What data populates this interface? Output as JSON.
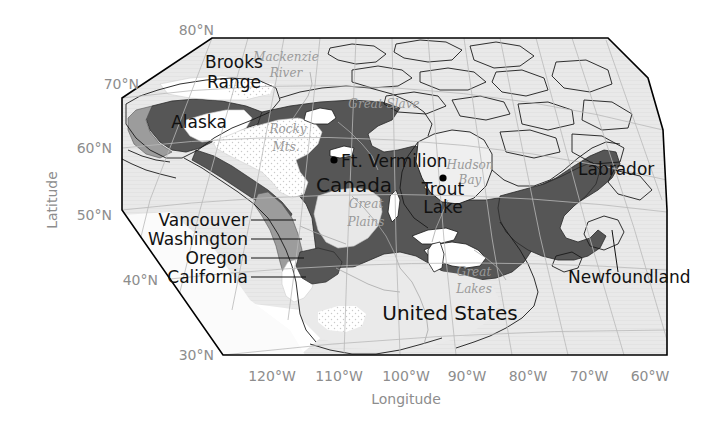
{
  "figure": {
    "type": "map",
    "projection_note": "North America, conic-style graticule",
    "background_color": "#ffffff",
    "frame_color": "#000000"
  },
  "axes": {
    "y_axis": {
      "title": "Latitude",
      "ticks": [
        "80°N",
        "70°N",
        "60°N",
        "50°N",
        "40°N",
        "30°N"
      ],
      "tick_color": "#8d8d8d"
    },
    "x_axis": {
      "title": "Longitude",
      "ticks": [
        "120°W",
        "110°W",
        "100°W",
        "90°W",
        "80°W",
        "70°W",
        "60°W"
      ],
      "tick_color": "#8d8d8d"
    }
  },
  "legend_colors": {
    "dark_shaded_region": "#565656",
    "medium_shaded_region": "#9c9c9c",
    "land_background": "#e6e6e6",
    "white_region": "#ffffff",
    "stippled_region": "#f4f4f4",
    "ocean": "#ffffff"
  },
  "labels": {
    "countries": [
      {
        "name": "Alaska",
        "text": "Alaska",
        "x": 168,
        "y": 122
      },
      {
        "name": "Canada",
        "text": "Canada",
        "x": 322,
        "y": 184
      },
      {
        "name": "United States",
        "text": "United States",
        "x": 450,
        "y": 313
      }
    ],
    "regions": [
      {
        "name": "Brooks Range line 1",
        "text": "Brooks",
        "x": 196,
        "y": 62
      },
      {
        "name": "Brooks Range line 2",
        "text": "Range",
        "x": 197,
        "y": 81
      },
      {
        "name": "Labrador",
        "text": "Labrador",
        "x": 578,
        "y": 170
      },
      {
        "name": "Newfoundland",
        "text": "Newfoundland",
        "x": 572,
        "y": 278
      }
    ],
    "coastal_states": [
      {
        "name": "Vancouver",
        "text": "Vancouver",
        "x": 168,
        "y": 224
      },
      {
        "name": "Washington",
        "text": "Washington",
        "x": 160,
        "y": 243
      },
      {
        "name": "Oregon",
        "text": "Oregon",
        "x": 186,
        "y": 262
      },
      {
        "name": "California",
        "text": "California",
        "x": 168,
        "y": 281
      }
    ],
    "cities": [
      {
        "name": "Ft. Vermilion",
        "text": "Ft. Vermilion",
        "x": 342,
        "y": 167,
        "dot_x": 334,
        "dot_y": 160
      },
      {
        "name": "Trout Lake line 1",
        "text": "Trout",
        "x": 437,
        "y": 188,
        "dot_x": 443,
        "dot_y": 178
      },
      {
        "name": "Trout Lake line 2",
        "text": "Lake",
        "x": 440,
        "y": 206
      }
    ],
    "physiographic": [
      {
        "name": "Mackenzie River line 1",
        "text": "Mackenzie",
        "x": 256,
        "y": 57
      },
      {
        "name": "Mackenzie River line 2",
        "text": "River",
        "x": 270,
        "y": 73
      },
      {
        "name": "Great Slave",
        "text": "Great Slave",
        "x": 352,
        "y": 104
      },
      {
        "name": "Hudson Bay line 1",
        "text": "Hudson",
        "x": 444,
        "y": 165
      },
      {
        "name": "Hudson Bay line 2",
        "text": "Bay",
        "x": 455,
        "y": 180
      },
      {
        "name": "Rocky Mts line 1",
        "text": "Rocky",
        "x": 272,
        "y": 128
      },
      {
        "name": "Rocky Mts line 2",
        "text": "Mts.",
        "x": 276,
        "y": 146
      },
      {
        "name": "Great Plains line 1",
        "text": "Great",
        "x": 356,
        "y": 203
      },
      {
        "name": "Great Plains line 2",
        "text": "Plains",
        "x": 353,
        "y": 221
      },
      {
        "name": "Great Lakes line 1",
        "text": "Great",
        "x": 465,
        "y": 271
      },
      {
        "name": "Great Lakes line 2",
        "text": "Lakes",
        "x": 462,
        "y": 288
      }
    ]
  },
  "tick_positions": {
    "latitude": [
      {
        "label": "80°N",
        "x": 188,
        "y": 30
      },
      {
        "label": "70°N",
        "x": 113,
        "y": 84
      },
      {
        "label": "60°N",
        "x": 86,
        "y": 148
      },
      {
        "label": "50°N",
        "x": 86,
        "y": 215
      },
      {
        "label": "40°N",
        "x": 132,
        "y": 280
      },
      {
        "label": "30°N",
        "x": 188,
        "y": 357
      }
    ],
    "longitude": [
      {
        "label": "120°W",
        "x": 272,
        "y": 376
      },
      {
        "label": "110°W",
        "x": 339,
        "y": 376
      },
      {
        "label": "100°W",
        "x": 406,
        "y": 376
      },
      {
        "label": "90°W",
        "x": 467,
        "y": 376
      },
      {
        "label": "80°W",
        "x": 528,
        "y": 376
      },
      {
        "label": "70°W",
        "x": 589,
        "y": 376
      },
      {
        "label": "60°W",
        "x": 650,
        "y": 376
      }
    ],
    "y_axis_title": {
      "label": "Latitude",
      "x": 57,
      "y": 200
    },
    "x_axis_title": {
      "label": "Longitude",
      "x": 406,
      "y": 399
    }
  }
}
